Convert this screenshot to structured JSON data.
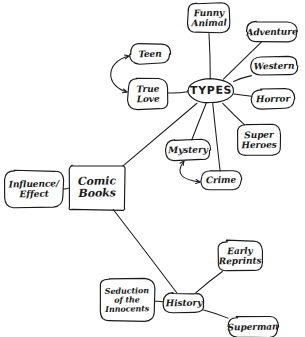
{
  "diagram": {
    "medium": "hand-drawn pencil sketch on white paper",
    "ink_color": "#1a1a1a",
    "paper_color": "#ffffff",
    "root": "Comic Books",
    "nodes": [
      {
        "id": "comic_books",
        "label": "Comic Books",
        "lines": [
          "Comic",
          "Books"
        ],
        "shape": "rectangle",
        "x": 97,
        "y": 188,
        "w": 56,
        "h": 44,
        "font": 11
      },
      {
        "id": "influence",
        "label": "Influence/ Effect",
        "lines": [
          "Influence/",
          "Effect"
        ],
        "shape": "rounded-rect",
        "x": 34,
        "y": 189,
        "w": 58,
        "h": 36,
        "font": 9
      },
      {
        "id": "types",
        "label": "TYPES",
        "lines": [
          "TYPES"
        ],
        "shape": "ellipse",
        "x": 211,
        "y": 91,
        "w": 46,
        "h": 24,
        "font": 11
      },
      {
        "id": "funny_animal",
        "label": "Funny Animal",
        "lines": [
          "Funny",
          "Animal"
        ],
        "shape": "rounded-rect",
        "x": 209,
        "y": 18,
        "w": 42,
        "h": 30,
        "font": 9
      },
      {
        "id": "adventure",
        "label": "Adventure",
        "lines": [
          "Adventure"
        ],
        "shape": "rounded-rect",
        "x": 272,
        "y": 32,
        "w": 50,
        "h": 20,
        "font": 9
      },
      {
        "id": "western",
        "label": "Western",
        "lines": [
          "Western"
        ],
        "shape": "rounded-rect",
        "x": 274,
        "y": 66,
        "w": 46,
        "h": 19,
        "font": 9
      },
      {
        "id": "horror",
        "label": "Horror",
        "lines": [
          "Horror"
        ],
        "shape": "rounded-rect",
        "x": 273,
        "y": 99,
        "w": 42,
        "h": 19,
        "font": 9
      },
      {
        "id": "super_heroes",
        "label": "Super Heroes",
        "lines": [
          "Super",
          "Heroes"
        ],
        "shape": "rounded-rect",
        "x": 259,
        "y": 140,
        "w": 44,
        "h": 30,
        "font": 9
      },
      {
        "id": "mystery",
        "label": "Mystery",
        "lines": [
          "Mystery"
        ],
        "shape": "rounded-rect",
        "x": 188,
        "y": 150,
        "w": 44,
        "h": 20,
        "font": 9
      },
      {
        "id": "crime",
        "label": "Crime",
        "lines": [
          "Crime"
        ],
        "shape": "rounded-rect",
        "x": 221,
        "y": 180,
        "w": 40,
        "h": 19,
        "font": 9
      },
      {
        "id": "teen",
        "label": "Teen",
        "lines": [
          "Teen"
        ],
        "shape": "rounded-rect",
        "x": 150,
        "y": 54,
        "w": 40,
        "h": 19,
        "font": 9
      },
      {
        "id": "true_love",
        "label": "True Love",
        "lines": [
          "True",
          "Love"
        ],
        "shape": "rounded-rect",
        "x": 148,
        "y": 94,
        "w": 40,
        "h": 30,
        "font": 9
      },
      {
        "id": "history",
        "label": "History",
        "lines": [
          "History"
        ],
        "shape": "rounded-rect",
        "x": 184,
        "y": 303,
        "w": 40,
        "h": 20,
        "font": 9
      },
      {
        "id": "seduction",
        "label": "Seduction of the Innocents",
        "lines": [
          "Seduction",
          "of the",
          "Innocents"
        ],
        "shape": "rounded-rect",
        "x": 127,
        "y": 300,
        "w": 54,
        "h": 42,
        "font": 8
      },
      {
        "id": "early_reprints",
        "label": "Early Reprints",
        "lines": [
          "Early",
          "Reprints"
        ],
        "shape": "rounded-rect",
        "x": 240,
        "y": 256,
        "w": 44,
        "h": 30,
        "font": 9
      },
      {
        "id": "superman",
        "label": "Superman",
        "lines": [
          "Superman"
        ],
        "shape": "rounded-rect",
        "x": 253,
        "y": 327,
        "w": 50,
        "h": 20,
        "font": 9
      }
    ],
    "edges": [
      {
        "id": "e_influence_comic",
        "from": "influence",
        "to": "comic_books",
        "style": "line"
      },
      {
        "id": "e_comic_types",
        "from": "comic_books",
        "to": "types",
        "style": "line"
      },
      {
        "id": "e_comic_history",
        "from": "comic_books",
        "to": "history",
        "style": "line"
      },
      {
        "id": "e_types_funny",
        "from": "types",
        "to": "funny_animal",
        "style": "line"
      },
      {
        "id": "e_types_adventure",
        "from": "types",
        "to": "adventure",
        "style": "line"
      },
      {
        "id": "e_types_western",
        "from": "types",
        "to": "western",
        "style": "line"
      },
      {
        "id": "e_types_horror",
        "from": "types",
        "to": "horror",
        "style": "line"
      },
      {
        "id": "e_types_super",
        "from": "types",
        "to": "super_heroes",
        "style": "line"
      },
      {
        "id": "e_types_mystery",
        "from": "types",
        "to": "mystery",
        "style": "line"
      },
      {
        "id": "e_types_crime",
        "from": "types",
        "to": "crime",
        "style": "line"
      },
      {
        "id": "e_types_truelove",
        "from": "types",
        "to": "true_love",
        "style": "line"
      },
      {
        "id": "e_teen_truelove",
        "from": "teen",
        "to": "true_love",
        "style": "double-arrow-curve"
      },
      {
        "id": "e_mystery_crime",
        "from": "mystery",
        "to": "crime",
        "style": "double-arrow-curve"
      },
      {
        "id": "e_history_seduction",
        "from": "history",
        "to": "seduction",
        "style": "line"
      },
      {
        "id": "e_history_early",
        "from": "history",
        "to": "early_reprints",
        "style": "line"
      },
      {
        "id": "e_history_superman",
        "from": "history",
        "to": "superman",
        "style": "line"
      }
    ]
  }
}
